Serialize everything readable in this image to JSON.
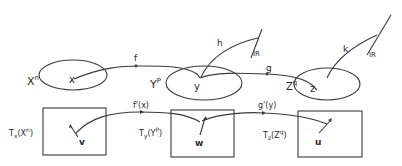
{
  "diagram": {
    "manifolds": [
      {
        "name": "X",
        "superscript": "n",
        "point": "x"
      },
      {
        "name": "Y",
        "superscript": "P",
        "point": "y"
      },
      {
        "name": "Z",
        "superscript": "q",
        "point": "z"
      }
    ],
    "maps": {
      "f": "f",
      "g": "g",
      "h": "h",
      "k": "k"
    },
    "targets": {
      "h_target": "IR",
      "k_target": "IR"
    },
    "tangent_spaces": [
      {
        "T": "T",
        "sub": "x",
        "arg": "(X",
        "argsup": "n",
        "close": ")",
        "vector": "v"
      },
      {
        "T": "T",
        "sub": "y",
        "arg": "(Y",
        "argsup": "P",
        "close": ")",
        "vector": "w"
      },
      {
        "T": "T",
        "sub": "z",
        "arg": "(Z",
        "argsup": "q",
        "close": ")",
        "vector": "u"
      }
    ],
    "derivatives": {
      "fprime": "f'(x)",
      "gprime": "g'(y)"
    },
    "colors": {
      "ink": "#3a3a3a",
      "background": "#ffffff"
    }
  }
}
